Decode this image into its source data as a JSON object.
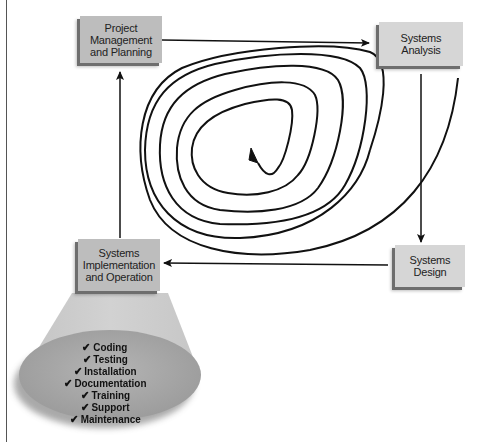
{
  "diagram": {
    "type": "spiral-lifecycle",
    "phases": [
      {
        "id": "planning",
        "label": "Project\nManagement\nand Planning"
      },
      {
        "id": "analysis",
        "label": "Systems\nAnalysis"
      },
      {
        "id": "design",
        "label": "Systems\nDesign"
      },
      {
        "id": "implementation",
        "label": "Systems\nImplementation\nand Operation"
      }
    ],
    "flow": [
      "planning",
      "analysis",
      "design",
      "implementation",
      "planning"
    ],
    "activities": {
      "check_glyph": "✔",
      "items": [
        "Coding",
        "Testing",
        "Installation",
        "Documentation",
        "Training",
        "Support",
        "Maintenance"
      ]
    },
    "colors": {
      "box_fill": "#bdbdbd",
      "box_fill_light": "#d6d6d6",
      "box_shadow": "#6e6e6e",
      "line": "#111111",
      "cone": "#c8c8c8",
      "ellipse": "#a8a8a8"
    }
  }
}
